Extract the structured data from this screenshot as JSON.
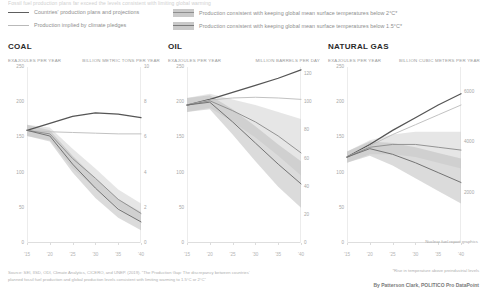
{
  "kicker": "Fossil fuel production plans far exceed the levels consistent with limiting global warming",
  "legend": {
    "items": [
      {
        "key": "plans",
        "label": "Countries' production plans and projections",
        "swatch": "line-dark",
        "color": "#5e5e5e"
      },
      {
        "key": "pledges",
        "label": "Production implied by climate pledges",
        "swatch": "line-light",
        "color": "#b9b9b9"
      },
      {
        "key": "below2",
        "label": "Production consistent with keeping global mean surface temperatures below 2°C*",
        "swatch": "band",
        "color": "#c9c9c9"
      },
      {
        "key": "below15",
        "label": "Production consistent with keeping global mean surface temperatures below 1.5°C*",
        "swatch": "band",
        "color": "#c9c9c9"
      }
    ]
  },
  "note_gas": "Nuclear fuel report graphics",
  "footer": {
    "source": "Source: SEI, IISD, ODI, Climate Analytics, CICERO, and UNEP. (2019). “The Production Gap: The discrepancy between countries’ planned fossil fuel production and global production levels consistent with limiting warming to 1.5°C or 2°C”",
    "footnote": "*Rise in temperature above preindustrial levels",
    "byline": "By Patterson Clark, POLITICO Pro DataPoint"
  },
  "chart_data": [
    {
      "id": "coal",
      "type": "line",
      "title": "COAL",
      "ylabel": "EXAJOULES PER YEAR",
      "ylabel_right": "BILLION METRIC TONS PER YEAR",
      "xlabel": "",
      "x": [
        2015,
        2020,
        2025,
        2030,
        2035,
        2040
      ],
      "xticklabels": [
        "'15",
        "'20",
        "'25",
        "'30",
        "'35",
        "'40"
      ],
      "yticks": [
        0,
        50,
        100,
        150,
        200,
        250
      ],
      "yticklabels": [
        "0",
        "50",
        "100",
        "150",
        "200",
        "250"
      ],
      "ylim": [
        0,
        250
      ],
      "yticks_right": [
        0,
        2,
        4,
        6,
        8,
        10
      ],
      "yticklabels_right": [
        "0",
        "2",
        "4",
        "6",
        "8",
        "10"
      ],
      "ylim_right": [
        0,
        10
      ],
      "series": [
        {
          "name": "Countries' production plans and projections",
          "values": [
            160,
            170,
            180,
            185,
            183,
            178
          ]
        },
        {
          "name": "Production implied by climate pledges",
          "values": [
            160,
            158,
            157,
            156,
            155,
            155
          ]
        },
        {
          "name": "Below 2°C median",
          "values": [
            160,
            155,
            120,
            92,
            62,
            42
          ]
        },
        {
          "name": "Below 1.5°C median",
          "values": [
            160,
            152,
            112,
            78,
            48,
            30
          ]
        }
      ],
      "bands": [
        {
          "name": "Below 2°C range",
          "upper": [
            168,
            164,
            134,
            106,
            76,
            56
          ],
          "lower": [
            152,
            146,
            106,
            78,
            50,
            30
          ]
        },
        {
          "name": "Below 1.5°C range",
          "upper": [
            168,
            160,
            124,
            92,
            62,
            44
          ],
          "lower": [
            152,
            144,
            100,
            64,
            36,
            18
          ]
        }
      ],
      "grid": false,
      "legend_position": "top"
    },
    {
      "id": "oil",
      "type": "line",
      "title": "OIL",
      "ylabel": "EXAJOULES PER YEAR",
      "ylabel_right": "MILLION BARRELS PER DAY",
      "xlabel": "",
      "x": [
        2015,
        2020,
        2025,
        2030,
        2035,
        2040
      ],
      "xticklabels": [
        "'15",
        "'20",
        "'25",
        "'30",
        "'35",
        "'40"
      ],
      "yticks": [
        0,
        50,
        100,
        150,
        200,
        250
      ],
      "yticklabels": [
        "0",
        "50",
        "100",
        "150",
        "200",
        "250"
      ],
      "ylim": [
        0,
        250
      ],
      "yticks_right": [
        0,
        20,
        40,
        60,
        80,
        100,
        120
      ],
      "yticklabels_right": [
        "0",
        "20",
        "40",
        "60",
        "80",
        "100",
        "120"
      ],
      "ylim_right": [
        0,
        125
      ],
      "series": [
        {
          "name": "Countries' production plans and projections",
          "values": [
            196,
            204,
            214,
            224,
            234,
            246
          ]
        },
        {
          "name": "Production implied by climate pledges",
          "values": [
            196,
            203,
            206,
            207,
            206,
            204
          ]
        },
        {
          "name": "Below 2°C median",
          "values": [
            196,
            202,
            188,
            172,
            152,
            128
          ]
        },
        {
          "name": "Below 1.5°C median",
          "values": [
            196,
            200,
            172,
            142,
            112,
            84
          ]
        }
      ],
      "bands": [
        {
          "name": "Below 2°C range",
          "upper": [
            206,
            212,
            204,
            196,
            186,
            176
          ],
          "lower": [
            186,
            192,
            172,
            150,
            124,
            96
          ]
        },
        {
          "name": "Below 1.5°C range",
          "upper": [
            206,
            210,
            190,
            166,
            140,
            116
          ],
          "lower": [
            186,
            190,
            154,
            116,
            80,
            50
          ]
        }
      ],
      "grid": false,
      "legend_position": "top"
    },
    {
      "id": "gas",
      "type": "line",
      "title": "NATURAL GAS",
      "ylabel": "EXAJOULES PER YEAR",
      "ylabel_right": "BILLION CUBIC METERS PER YEAR",
      "xlabel": "",
      "x": [
        2015,
        2020,
        2025,
        2030,
        2035,
        2040
      ],
      "xticklabels": [
        "'15",
        "'20",
        "'25",
        "'30",
        "'35",
        "'40"
      ],
      "yticks": [
        0,
        50,
        100,
        150,
        200,
        250
      ],
      "yticklabels": [
        "0",
        "50",
        "100",
        "150",
        "200",
        "250"
      ],
      "ylim": [
        0,
        250
      ],
      "yticks_right": [
        2000,
        4000,
        6000
      ],
      "yticklabels_right": [
        "2000",
        "4000",
        "6000"
      ],
      "ylim_right": [
        0,
        7000
      ],
      "series": [
        {
          "name": "Countries' production plans and projections",
          "values": [
            122,
            140,
            160,
            178,
            196,
            212
          ]
        },
        {
          "name": "Production implied by climate pledges",
          "values": [
            122,
            138,
            154,
            168,
            182,
            196
          ]
        },
        {
          "name": "Below 2°C median",
          "values": [
            122,
            136,
            140,
            140,
            136,
            132
          ]
        },
        {
          "name": "Below 1.5°C median",
          "values": [
            122,
            134,
            126,
            114,
            100,
            86
          ]
        }
      ],
      "bands": [
        {
          "name": "Below 2°C range",
          "upper": [
            130,
            146,
            154,
            158,
            158,
            158
          ],
          "lower": [
            114,
            126,
            126,
            122,
            114,
            106
          ]
        },
        {
          "name": "Below 1.5°C range",
          "upper": [
            130,
            144,
            142,
            136,
            128,
            120
          ],
          "lower": [
            114,
            124,
            110,
            92,
            74,
            56
          ]
        }
      ],
      "grid": false,
      "legend_position": "top"
    }
  ]
}
